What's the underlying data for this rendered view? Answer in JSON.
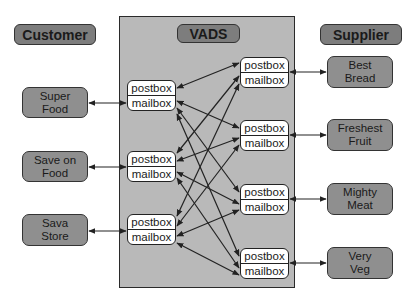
{
  "headers": {
    "customer": "Customer",
    "vads": "VADS",
    "supplier": "Supplier"
  },
  "customers": [
    {
      "label": "Super\nFood"
    },
    {
      "label": "Save on\nFood"
    },
    {
      "label": "Sava\nStore"
    }
  ],
  "suppliers": [
    {
      "label": "Best\nBread"
    },
    {
      "label": "Freshest\nFruit"
    },
    {
      "label": "Mighty\nMeat"
    },
    {
      "label": "Very\nVeg"
    }
  ],
  "vads_left_boxes": [
    {
      "top": "postbox",
      "bottom": "mailbox"
    },
    {
      "top": "postbox",
      "bottom": "mailbox"
    },
    {
      "top": "postbox",
      "bottom": "mailbox"
    }
  ],
  "vads_right_boxes": [
    {
      "top": "postbox",
      "bottom": "mailbox"
    },
    {
      "top": "postbox",
      "bottom": "mailbox"
    },
    {
      "top": "postbox",
      "bottom": "mailbox"
    },
    {
      "top": "postbox",
      "bottom": "mailbox"
    }
  ],
  "colors": {
    "panel": "#b9b9b9",
    "entity": "#8f8f8f",
    "header": "#7d7d7d",
    "box": "#ffffff",
    "line": "#222222"
  }
}
